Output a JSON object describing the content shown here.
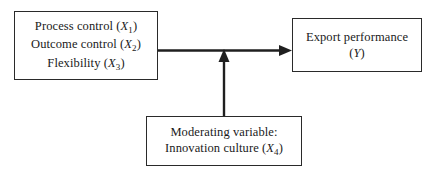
{
  "diagram": {
    "type": "conceptual-model",
    "background_color": "#ffffff",
    "line_color": "#1f1f1f",
    "border_color": "#2a2a2a",
    "nodes": [
      {
        "id": "antecedents",
        "role": "independent-variables",
        "lines": [
          {
            "text": "Process control (",
            "var": "X",
            "sub": "1",
            "close": ")"
          },
          {
            "text": "Outcome control (",
            "var": "X",
            "sub": "2",
            "close": ")"
          },
          {
            "text": "Flexibility (",
            "var": "X",
            "sub": "3",
            "close": ")"
          }
        ]
      },
      {
        "id": "outcome",
        "role": "dependent-variable",
        "lines": [
          {
            "text": "Export performance",
            "var": "",
            "sub": "",
            "close": ""
          },
          {
            "text": "(",
            "var": "Y",
            "sub": "",
            "close": ")"
          }
        ]
      },
      {
        "id": "moderator",
        "role": "moderating-variable",
        "lines": [
          {
            "text": "Moderating variable:",
            "var": "",
            "sub": "",
            "close": ""
          },
          {
            "text": "Innovation culture (",
            "var": "X",
            "sub": "4",
            "close": ")"
          }
        ]
      }
    ],
    "connectors": [
      {
        "id": "main-effect",
        "from": "antecedents",
        "to": "outcome",
        "orientation": "horizontal",
        "arrowhead": "right"
      },
      {
        "id": "moderation-effect",
        "from": "moderator",
        "to": "main-effect",
        "orientation": "vertical",
        "arrowhead": "up"
      }
    ]
  }
}
